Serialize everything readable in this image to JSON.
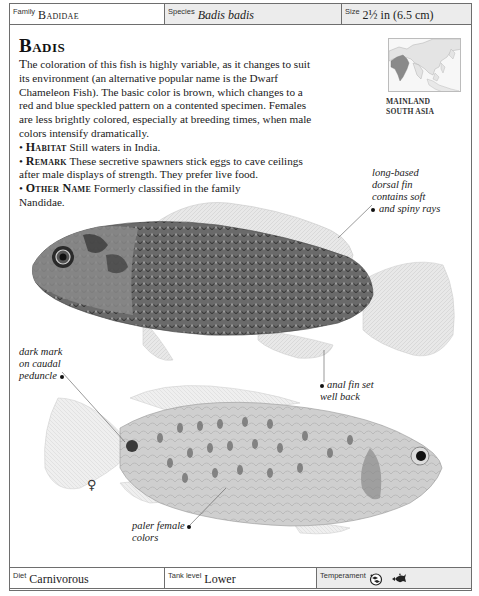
{
  "header": {
    "family_label": "Family",
    "family_value": "Badidae",
    "species_label": "Species",
    "species_value": "Badis badis",
    "size_label": "Size",
    "size_value": "2½ in (6.5 cm)"
  },
  "entry": {
    "title": "Badis",
    "description_lead": "T",
    "description": "he coloration of this fish is highly variable, as it changes to suit its environment (an alternative popular name is the Dwarf Chameleon Fish). The basic color is brown, which changes to a red and blue speckled pattern on a contented specimen. Females are less brightly colored, especially at breeding times, when male colors intensify dramatically.",
    "bullets": [
      {
        "keyword": "Habitat",
        "text": "Still waters in India."
      },
      {
        "keyword": "Remark",
        "text": "These secretive spawners stick eggs to cave ceilings after male displays of strength. They prefer live food."
      },
      {
        "keyword": "Other Name",
        "text": "Formerly classified in the family Nandidae."
      }
    ]
  },
  "map": {
    "caption_line1": "MAINLAND",
    "caption_line2": "SOUTH ASIA"
  },
  "annotations": {
    "dorsal_fin": [
      "long-based",
      "dorsal fin",
      "contains soft",
      "and spiny rays"
    ],
    "caudal_mark": [
      "dark mark",
      "on caudal",
      "peduncle"
    ],
    "anal_fin": [
      "anal fin set",
      "well back"
    ],
    "female_colors": [
      "paler female",
      "colors"
    ],
    "female_symbol": "♀"
  },
  "footer": {
    "diet_label": "Diet",
    "diet_value": "Carnivorous",
    "tank_label": "Tank level",
    "tank_value": "Lower",
    "temperament_label": "Temperament",
    "temperament_icons": [
      "community-fish-icon",
      "territorial-fish-icon"
    ]
  },
  "colors": {
    "border": "#6e6e6e",
    "cell_gray": "#ececec",
    "map_region": "#8a8a8a"
  }
}
